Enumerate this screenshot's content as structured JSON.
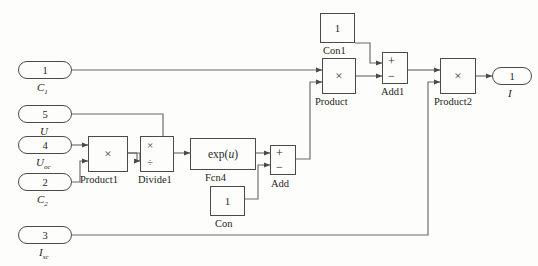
{
  "diagram": {
    "type": "simulink-block-diagram",
    "background_color": "#fdfdfb",
    "line_color": "#5a5a5a",
    "block_border_color": "#4a4a4a"
  },
  "ports": {
    "inputs": [
      {
        "number": "1",
        "label": "C",
        "subscript": "1",
        "name": "inport-c1"
      },
      {
        "number": "5",
        "label": "U",
        "subscript": "",
        "name": "inport-u"
      },
      {
        "number": "4",
        "label": "U",
        "subscript": "oc",
        "name": "inport-uoc"
      },
      {
        "number": "2",
        "label": "C",
        "subscript": "2",
        "name": "inport-c2"
      },
      {
        "number": "3",
        "label": "I",
        "subscript": "sc",
        "name": "inport-isc"
      }
    ],
    "outputs": [
      {
        "number": "1",
        "label": "I",
        "subscript": "",
        "name": "outport-i"
      }
    ]
  },
  "blocks": [
    {
      "id": "product1",
      "label": "Product1",
      "symbol": "×",
      "kind": "product"
    },
    {
      "id": "divide1",
      "label": "Divide1",
      "symbol_top": "×",
      "symbol_bottom": "÷",
      "kind": "divide"
    },
    {
      "id": "fcn4",
      "label": "Fcn4",
      "expr_prefix": "exp(",
      "expr_var": "u",
      "expr_suffix": ")",
      "kind": "function"
    },
    {
      "id": "con",
      "label": "Con",
      "value": "1",
      "kind": "constant"
    },
    {
      "id": "add",
      "label": "Add",
      "sign_top": "+",
      "sign_bottom": "−",
      "kind": "sum"
    },
    {
      "id": "con1",
      "label": "Con1",
      "value": "1",
      "kind": "constant"
    },
    {
      "id": "product",
      "label": "Product",
      "symbol": "×",
      "kind": "product"
    },
    {
      "id": "add1",
      "label": "Add1",
      "sign_top": "+",
      "sign_bottom": "−",
      "kind": "sum"
    },
    {
      "id": "product2",
      "label": "Product2",
      "symbol": "×",
      "kind": "product"
    }
  ]
}
